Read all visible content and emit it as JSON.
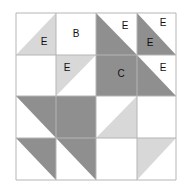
{
  "diagram": {
    "colors": {
      "dark": "#8f8f8f",
      "light": "#d8d8d8",
      "white": "#ffffff",
      "grid": "#b5b5b5",
      "text": "#111111"
    },
    "grid": {
      "x": [
        16,
        56,
        96,
        137,
        176
      ],
      "y": [
        13,
        55,
        96,
        138,
        180
      ]
    },
    "labels": [
      {
        "id": "label-e-1",
        "text": "E",
        "x": 44,
        "y": 41
      },
      {
        "id": "label-b",
        "text": "B",
        "x": 76,
        "y": 36
      },
      {
        "id": "label-e-2",
        "text": "E",
        "x": 125,
        "y": 28
      },
      {
        "id": "label-e-3",
        "text": "E",
        "x": 163,
        "y": 25
      },
      {
        "id": "label-e-4",
        "text": "E",
        "x": 150,
        "y": 46
      },
      {
        "id": "label-e-5",
        "text": "E",
        "x": 67,
        "y": 70
      },
      {
        "id": "label-c",
        "text": "C",
        "x": 121,
        "y": 76
      },
      {
        "id": "label-e-6",
        "text": "E",
        "x": 163,
        "y": 71
      }
    ]
  }
}
